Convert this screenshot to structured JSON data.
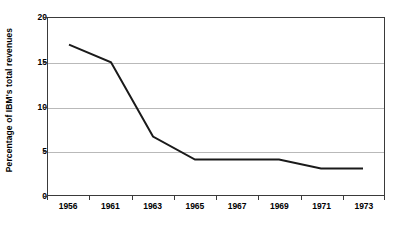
{
  "chart_data": {
    "type": "line",
    "title": "",
    "subtitle": "",
    "xlabel": "",
    "ylabel": "Percentage of IBM's total revenues",
    "categories": [
      "1956",
      "1961",
      "1963",
      "1965",
      "1967",
      "1969",
      "1971",
      "1973"
    ],
    "series": [
      {
        "name": "Percentage of IBM's total revenues",
        "values": [
          17,
          15,
          6.6,
          4,
          4,
          4,
          3,
          3
        ],
        "color": "#1a1a1a"
      }
    ],
    "ylim": [
      0,
      20
    ],
    "yticks": [
      0,
      5,
      10,
      15,
      20
    ],
    "ytick_labels": [
      "0",
      "5",
      "10",
      "15",
      "20"
    ],
    "grid": true,
    "grid_axis": "y",
    "grid_color": "#b9b9b9",
    "legend": false,
    "legend_position": "none",
    "axis_color": "#3a3a3a",
    "background_color": "#ffffff",
    "line_width": 2,
    "annotations": []
  }
}
